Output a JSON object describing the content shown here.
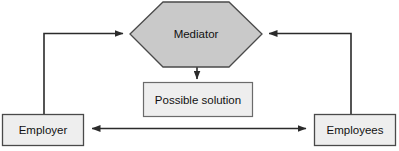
{
  "diagram": {
    "background_color": "#ffffff",
    "stroke_color": "#2b2b2b",
    "hexagon_fill": "#c9c9c9",
    "box_fill": "#eeeeee",
    "nodes": [
      {
        "id": "mediator",
        "label": "Mediator",
        "shape": "hexagon",
        "fill": "#c9c9c9"
      },
      {
        "id": "solution",
        "label": "Possible solution",
        "shape": "rectangle",
        "fill": "#eeeeee"
      },
      {
        "id": "employer",
        "label": "Employer",
        "shape": "rectangle",
        "fill": "#eeeeee"
      },
      {
        "id": "employees",
        "label": "Employees",
        "shape": "rectangle",
        "fill": "#eeeeee"
      }
    ],
    "edges": [
      {
        "id": "employer-to-mediator",
        "from": "employer",
        "to": "mediator",
        "direction": "one-way"
      },
      {
        "id": "employees-to-mediator",
        "from": "employees",
        "to": "mediator",
        "direction": "one-way"
      },
      {
        "id": "mediator-to-solution",
        "from": "mediator",
        "to": "solution",
        "direction": "one-way"
      },
      {
        "id": "employer-employees",
        "from": "employer",
        "to": "employees",
        "direction": "two-way"
      }
    ]
  }
}
